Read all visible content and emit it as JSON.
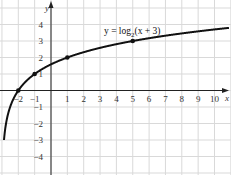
{
  "chart_data": {
    "type": "line",
    "title": "",
    "annotation": "y = log2(x + 3)",
    "function": "log2(x+3)",
    "xlabel": "x",
    "ylabel": "y",
    "xlim": [
      -3,
      11
    ],
    "ylim": [
      -5,
      5
    ],
    "grid": true,
    "legend": "none",
    "x_ticks": [
      -2,
      -1,
      1,
      2,
      3,
      4,
      5,
      6,
      7,
      8,
      9,
      10
    ],
    "y_ticks": [
      -4,
      -3,
      -2,
      -1,
      1,
      2,
      3,
      4
    ],
    "x_tick_labels": [
      "−2",
      "−1",
      "1",
      "2",
      "3",
      "4",
      "5",
      "6",
      "7",
      "8",
      "9",
      "10"
    ],
    "y_tick_labels": [
      "−4",
      "−3",
      "−2",
      "−1",
      "1",
      "2",
      "3",
      "4"
    ],
    "series": [
      {
        "name": "y = log2(x + 3)",
        "x": [
          -2.875,
          -2.75,
          -2.5,
          -2,
          -1,
          0,
          1,
          2,
          3,
          4,
          5,
          6,
          7,
          8,
          9,
          10,
          11
        ],
        "values": [
          -3,
          -2,
          -1,
          0,
          1,
          1.585,
          2,
          2.322,
          2.585,
          2.807,
          3,
          3.17,
          3.322,
          3.459,
          3.585,
          3.7,
          3.807
        ]
      }
    ],
    "marked_points": [
      {
        "x": -2,
        "y": 0
      },
      {
        "x": -1,
        "y": 1
      },
      {
        "x": 1,
        "y": 2
      },
      {
        "x": 5,
        "y": 3
      }
    ]
  },
  "labels": {
    "x_axis": "x",
    "y_axis": "y",
    "equation_prefix": "y = log",
    "equation_base": "2",
    "equation_suffix": "(x + 3)"
  }
}
